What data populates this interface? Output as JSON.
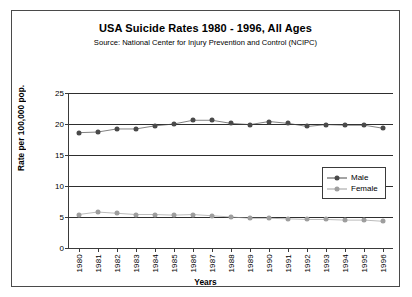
{
  "chart_data": {
    "type": "line",
    "title": "USA Suicide Rates 1980 - 1996, All Ages",
    "subtitle": "Source: National Center for Injury Prevention and Control (NCIPC)",
    "xlabel": "Years",
    "ylabel": "Rate per 100,000 pop.",
    "categories": [
      "1980",
      "1981",
      "1982",
      "1983",
      "1984",
      "1985",
      "1986",
      "1987",
      "1988",
      "1989",
      "1990",
      "1991",
      "1992",
      "1993",
      "1994",
      "1995",
      "1996"
    ],
    "ylim": [
      0,
      25
    ],
    "yticks": [
      0,
      5,
      10,
      15,
      20,
      25
    ],
    "grid": true,
    "legend_position": "right-middle",
    "series": [
      {
        "name": "Male",
        "color": "#4a4a4a",
        "values": [
          18.6,
          18.7,
          19.2,
          19.2,
          19.7,
          20.0,
          20.6,
          20.6,
          20.1,
          19.9,
          20.4,
          20.1,
          19.6,
          19.9,
          19.8,
          19.8,
          19.3
        ]
      },
      {
        "name": "Female",
        "color": "#9e9e9e",
        "values": [
          5.4,
          5.8,
          5.6,
          5.4,
          5.4,
          5.3,
          5.4,
          5.2,
          5.0,
          4.8,
          4.8,
          4.7,
          4.6,
          4.6,
          4.5,
          4.5,
          4.3
        ]
      }
    ]
  },
  "legend": {
    "items": [
      {
        "label": "Male"
      },
      {
        "label": "Female"
      }
    ]
  },
  "corner": {
    "artifact_text": ""
  }
}
